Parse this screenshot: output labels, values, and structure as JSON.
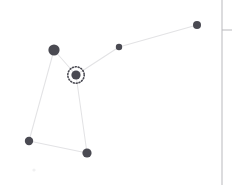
{
  "canvas": {
    "width": 232,
    "height": 185,
    "background": "#ffffff",
    "title": "Graph node canvas"
  },
  "graph": {
    "node_color": "#4a4a52",
    "edge_color": "#e3e3e5",
    "selection_ring_color": "#4a4a52",
    "nodes": [
      {
        "id": "n1",
        "label": "node-top-left",
        "x": 54,
        "y": 50,
        "r": 5.6,
        "selected": false
      },
      {
        "id": "n2",
        "label": "node-center-selected",
        "x": 76,
        "y": 75,
        "r": 4.6,
        "selected": true
      },
      {
        "id": "n3",
        "label": "node-mid-right",
        "x": 119,
        "y": 47,
        "r": 3.2,
        "selected": false
      },
      {
        "id": "n4",
        "label": "node-far-right",
        "x": 197,
        "y": 25,
        "r": 4.0,
        "selected": false
      },
      {
        "id": "n5",
        "label": "node-bottom-left",
        "x": 29,
        "y": 141,
        "r": 4.2,
        "selected": false
      },
      {
        "id": "n6",
        "label": "node-bottom-mid",
        "x": 87,
        "y": 153,
        "r": 4.6,
        "selected": false
      }
    ],
    "edges": [
      {
        "id": "e1",
        "from": "n1",
        "to": "n2",
        "label": "edge-topleft-center"
      },
      {
        "id": "e2",
        "from": "n2",
        "to": "n3",
        "label": "edge-center-midright"
      },
      {
        "id": "e3",
        "from": "n3",
        "to": "n4",
        "label": "edge-midright-farright"
      },
      {
        "id": "e4",
        "from": "n1",
        "to": "n5",
        "label": "edge-topleft-bottomleft"
      },
      {
        "id": "e5",
        "from": "n2",
        "to": "n6",
        "label": "edge-center-bottommid"
      },
      {
        "id": "e6",
        "from": "n5",
        "to": "n6",
        "label": "edge-bottomleft-bottommid"
      }
    ],
    "selected_node_id": "n2",
    "selection_ring_radius": 8.2,
    "node_count": 6,
    "edge_count": 6
  },
  "panel": {
    "divider_x": 222,
    "divider_color": "#b9b9bd",
    "tick_y": 30,
    "tick_x_start": 222,
    "tick_x_end": 232
  },
  "artifacts": [
    {
      "id": "a1",
      "label": "faint-speck",
      "x": 34,
      "y": 170,
      "r": 1.6,
      "color": "#f0f0f1"
    }
  ]
}
